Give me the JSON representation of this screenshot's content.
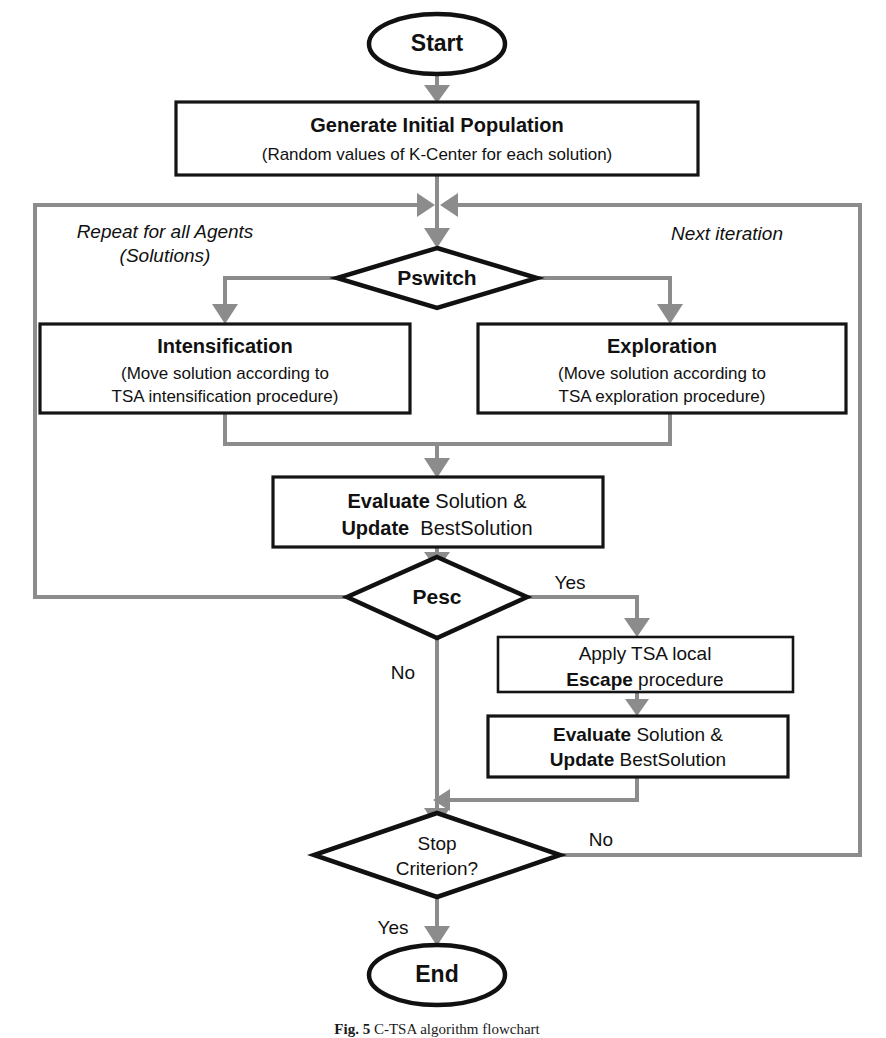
{
  "figure": {
    "domain": "Diagram",
    "type": "flowchart",
    "caption_prefix": "Fig. 5",
    "caption_text": "C-TSA algorithm flowchart",
    "canvas": {
      "width": 886,
      "height": 1038
    },
    "colors": {
      "background": "#ffffff",
      "node_stroke": "#111111",
      "connector": "#8c8c8c",
      "text": "#111111"
    }
  },
  "nodes": {
    "start": {
      "id": "start",
      "shape": "ellipse",
      "label": "Start"
    },
    "generate": {
      "id": "generate-initial-population",
      "shape": "process",
      "title": "Generate Initial Population",
      "subtitle": "(Random values of K-Center for each solution)"
    },
    "pswitch": {
      "id": "pswitch",
      "shape": "decision",
      "label": "Pswitch"
    },
    "intensification": {
      "id": "intensification",
      "shape": "process",
      "title": "Intensification",
      "line2": "(Move solution according to",
      "line3": "TSA intensification procedure)"
    },
    "exploration": {
      "id": "exploration",
      "shape": "process",
      "title": "Exploration",
      "line2": "(Move solution according to",
      "line3": "TSA exploration procedure)"
    },
    "evaluate_main": {
      "id": "evaluate-update-main",
      "shape": "process",
      "line1_bold": "Evaluate",
      "line1_rest": " Solution &",
      "line2_bold": "Update",
      "line2_rest": "  BestSolution"
    },
    "pesc": {
      "id": "pesc",
      "shape": "decision",
      "label": "Pesc"
    },
    "escape": {
      "id": "apply-tsa-local-escape",
      "shape": "process",
      "line1": "Apply TSA local",
      "line2_bold": "Escape",
      "line2_rest": " procedure"
    },
    "evaluate_escape": {
      "id": "evaluate-update-escape",
      "shape": "process",
      "line1_bold": "Evaluate",
      "line1_rest": " Solution &",
      "line2_bold": "Update",
      "line2_rest": " BestSolution"
    },
    "stop": {
      "id": "stop-criterion",
      "shape": "decision",
      "line1": "Stop",
      "line2": "Criterion?"
    },
    "end": {
      "id": "end",
      "shape": "ellipse",
      "label": "End"
    }
  },
  "annotations": {
    "repeat_line1": "Repeat for all Agents",
    "repeat_line2": "(Solutions)",
    "next_iteration": "Next iteration"
  },
  "edge_labels": {
    "pesc_yes": "Yes",
    "pesc_no": "No",
    "stop_no": "No",
    "stop_yes": "Yes"
  },
  "edges": [
    {
      "from": "start",
      "to": "generate",
      "label": ""
    },
    {
      "from": "generate",
      "to": "pswitch",
      "label": ""
    },
    {
      "from": "pswitch",
      "to": "intensification",
      "label": ""
    },
    {
      "from": "pswitch",
      "to": "exploration",
      "label": ""
    },
    {
      "from": "intensification",
      "to": "evaluate_main",
      "label": ""
    },
    {
      "from": "exploration",
      "to": "evaluate_main",
      "label": ""
    },
    {
      "from": "evaluate_main",
      "to": "pesc",
      "label": ""
    },
    {
      "from": "pesc",
      "to": "escape",
      "label": "Yes"
    },
    {
      "from": "pesc",
      "to": "stop",
      "label": "No"
    },
    {
      "from": "escape",
      "to": "evaluate_escape",
      "label": ""
    },
    {
      "from": "evaluate_escape",
      "to": "stop",
      "label": ""
    },
    {
      "from": "pesc",
      "to": "pswitch",
      "label": "Repeat for all Agents (Solutions)"
    },
    {
      "from": "stop",
      "to": "pswitch",
      "label": "No / Next iteration"
    },
    {
      "from": "stop",
      "to": "end",
      "label": "Yes"
    }
  ]
}
